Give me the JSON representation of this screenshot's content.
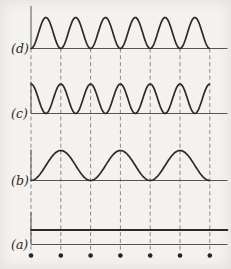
{
  "figure": {
    "width": 231,
    "height": 269,
    "background": "#f3f2ee",
    "wave_color": "#2d2a26",
    "axis_color": "#57544e",
    "dash_color": "#8e8b85",
    "dot_color": "#26231e",
    "label_color": "#2b2925",
    "grid": {
      "x_start": 31,
      "spacing": 29.8,
      "count": 7,
      "top_y": 48.5,
      "bottom_y": 251.5,
      "dash_pattern": "4 2.8"
    },
    "baseline_x_end": 227.5,
    "dots": {
      "y": 255.5,
      "radius": 2.3
    },
    "panels": [
      {
        "id": "d",
        "label": "(d)",
        "waveform": "sin2",
        "phase": "zero-at-gridlines",
        "cycles": 6,
        "baseline_y": 48.5,
        "peak_height": 31,
        "axis_top_y": 6,
        "label_x": 11,
        "label_y": 53
      },
      {
        "id": "c",
        "label": "(c)",
        "waveform": "sin2",
        "phase": "peak-at-gridlines",
        "cycles": 6,
        "baseline_y": 113.5,
        "peak_height": 29.5,
        "axis_top_y": 81.5,
        "label_x": 11,
        "label_y": 118
      },
      {
        "id": "b",
        "label": "(b)",
        "waveform": "sin2",
        "phase": "zero-at-gridlines",
        "cycles": 3,
        "baseline_y": 180.5,
        "peak_height": 30,
        "axis_top_y": 149.5,
        "label_x": 11,
        "label_y": 184.5
      },
      {
        "id": "a",
        "label": "(a)",
        "waveform": "constant",
        "cycles": 0,
        "baseline_y": 244.5,
        "peak_height": 14.5,
        "axis_top_y": 212,
        "label_x": 11,
        "label_y": 249
      }
    ]
  },
  "chart_data": {
    "type": "line",
    "title": "",
    "xlabel": "",
    "ylabel": "",
    "x_gridlines": [
      0,
      1,
      2,
      3,
      4,
      5,
      6
    ],
    "series": [
      {
        "name": "(d)",
        "waveform": "sin^2 humps",
        "cycles_across_figure": 6,
        "zeros_at_gridlines": true,
        "relative_amplitude": 1
      },
      {
        "name": "(c)",
        "waveform": "cos^2 humps",
        "cycles_across_figure": 6,
        "peaks_at_gridlines": true,
        "relative_amplitude": 1
      },
      {
        "name": "(b)",
        "waveform": "sin^2 humps",
        "cycles_across_figure": 3,
        "zeros_at_gridlines": true,
        "relative_amplitude": 1
      },
      {
        "name": "(a)",
        "waveform": "constant (flat line above baseline)",
        "cycles_across_figure": 0,
        "relative_amplitude": 0.5
      }
    ],
    "legend": "none",
    "grid": "dashed vertical lines with dots at bottom ends",
    "annotations": [
      "(a)",
      "(b)",
      "(c)",
      "(d)"
    ]
  }
}
